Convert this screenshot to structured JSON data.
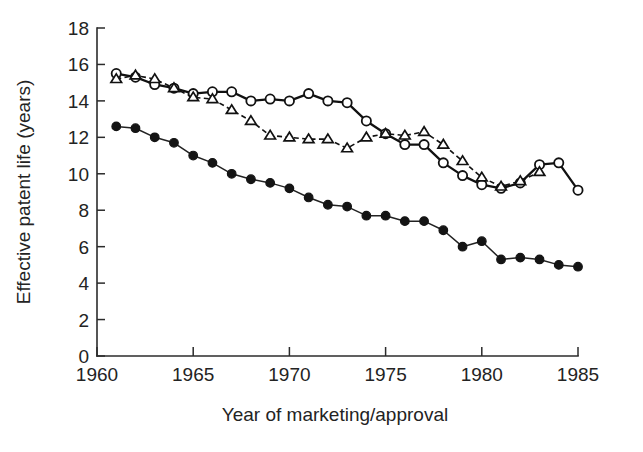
{
  "chart_data": {
    "type": "line",
    "title": "",
    "subtitle": "",
    "xlabel": "Year of marketing/approval",
    "ylabel": "Effective patent life (years)",
    "xlim": [
      1960,
      1985
    ],
    "ylim": [
      0,
      18
    ],
    "xticks": [
      1960,
      1965,
      1970,
      1975,
      1980,
      1985
    ],
    "xticklabels": [
      "1960",
      "1965",
      "1970",
      "1975",
      "1980",
      "1985"
    ],
    "yticks": [
      0,
      2,
      4,
      6,
      8,
      10,
      12,
      14,
      16,
      18
    ],
    "yticklabels": [
      "0",
      "2",
      "4",
      "6",
      "8",
      "10",
      "12",
      "14",
      "16",
      "18"
    ],
    "grid": false,
    "legend": "none",
    "series": [
      {
        "name": "open-circle-series",
        "marker": "open-circle",
        "linestyle": "solid",
        "x": [
          1961,
          1962,
          1963,
          1964,
          1965,
          1966,
          1967,
          1968,
          1969,
          1970,
          1971,
          1972,
          1973,
          1974,
          1975,
          1976,
          1977,
          1978,
          1979,
          1980,
          1981,
          1982,
          1983,
          1984,
          1985
        ],
        "values": [
          15.5,
          15.3,
          14.9,
          14.7,
          14.4,
          14.5,
          14.5,
          14.0,
          14.1,
          14.0,
          14.4,
          14.0,
          13.9,
          12.9,
          12.2,
          11.6,
          11.6,
          10.6,
          9.9,
          9.4,
          9.2,
          9.5,
          10.5,
          10.6,
          9.1
        ]
      },
      {
        "name": "open-triangle-series",
        "marker": "open-triangle",
        "linestyle": "dashed",
        "x": [
          1961,
          1962,
          1963,
          1964,
          1965,
          1966,
          1967,
          1968,
          1969,
          1970,
          1971,
          1972,
          1973,
          1974,
          1975,
          1976,
          1977,
          1978,
          1979,
          1980,
          1981,
          1982,
          1983
        ],
        "values": [
          15.2,
          15.4,
          15.2,
          14.7,
          14.2,
          14.1,
          13.5,
          12.9,
          12.1,
          12.0,
          11.9,
          11.9,
          11.4,
          12.0,
          12.2,
          12.1,
          12.3,
          11.6,
          10.7,
          9.8,
          9.3,
          9.6,
          10.1
        ]
      },
      {
        "name": "filled-circle-series",
        "marker": "filled-circle",
        "linestyle": "solid",
        "x": [
          1961,
          1962,
          1963,
          1964,
          1965,
          1966,
          1967,
          1968,
          1969,
          1970,
          1971,
          1972,
          1973,
          1974,
          1975,
          1976,
          1977,
          1978,
          1979,
          1980,
          1981,
          1982,
          1983,
          1984,
          1985
        ],
        "values": [
          12.6,
          12.5,
          12.0,
          11.7,
          11.0,
          10.6,
          10.0,
          9.7,
          9.5,
          9.2,
          8.7,
          8.3,
          8.2,
          7.7,
          7.7,
          7.4,
          7.4,
          6.9,
          6.0,
          6.3,
          5.3,
          5.4,
          5.3,
          5.0,
          4.9
        ]
      }
    ]
  }
}
